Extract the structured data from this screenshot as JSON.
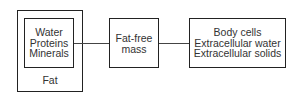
{
  "diagram": {
    "type": "body-composition",
    "nodes": {
      "fat": {
        "label": "Fat"
      },
      "components": {
        "lines": [
          "Water",
          "Proteins",
          "Minerals"
        ]
      },
      "fat_free_mass": {
        "lines": [
          "Fat-free",
          "mass"
        ]
      },
      "cells": {
        "lines": [
          "Body cells",
          "Extracellular water",
          "Extracellular solids"
        ]
      }
    },
    "edges": [
      {
        "from": "components",
        "to": "fat_free_mass"
      },
      {
        "from": "fat_free_mass",
        "to": "cells"
      }
    ]
  }
}
